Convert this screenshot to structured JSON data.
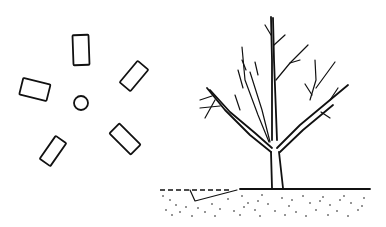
{
  "illustration": {
    "left_panel": {
      "description": "Top view: five rectangular pieces arranged radially around a small central circle",
      "center_circle": {
        "cx": 81,
        "cy": 103,
        "r": 7
      },
      "rectangles": [
        {
          "id": "top",
          "cx": 81,
          "cy": 50,
          "w": 16,
          "h": 30,
          "rotate": -2
        },
        {
          "id": "upper-right",
          "cx": 134,
          "cy": 76,
          "w": 14,
          "h": 28,
          "rotate": 40
        },
        {
          "id": "left",
          "cx": 35,
          "cy": 89,
          "w": 28,
          "h": 17,
          "rotate": 14
        },
        {
          "id": "lower-right",
          "cx": 125,
          "cy": 139,
          "w": 14,
          "h": 30,
          "rotate": -45
        },
        {
          "id": "lower-left",
          "cx": 53,
          "cy": 151,
          "w": 13,
          "h": 28,
          "rotate": 35
        }
      ]
    },
    "right_panel": {
      "description": "Side view: bare deciduous tree planted in stippled ground with a cut trench on the left",
      "colors": {
        "ink": "#111111",
        "background": "#ffffff"
      }
    }
  }
}
